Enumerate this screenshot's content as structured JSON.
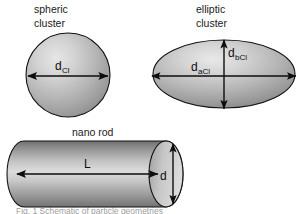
{
  "figure": {
    "width": 298,
    "height": 214,
    "background": "#ffffff",
    "outline_color": "#111111",
    "arrow_color": "#0d0d0d"
  },
  "panels": {
    "spheric": {
      "title_line1": "spheric",
      "title_line2": "cluster",
      "dimension": {
        "base": "d",
        "subscript": "Cl",
        "full": "dCl",
        "orientation": "horizontal",
        "arrow_style": "double-headed"
      },
      "shape": "sphere",
      "shading": {
        "type": "radial",
        "highlight": "#e0e0e0",
        "mid": "#b4b4b4",
        "shadow": "#8c8c8c"
      }
    },
    "elliptic": {
      "title_line1": "elliptic",
      "title_line2": "cluster",
      "dimension_major": {
        "base": "d",
        "subscript": "aCl",
        "full": "daCl",
        "orientation": "horizontal",
        "arrow_style": "double-headed"
      },
      "dimension_minor": {
        "base": "d",
        "subscript": "bCl",
        "full": "dbCl",
        "orientation": "vertical",
        "arrow_style": "double-headed"
      },
      "shape": "ellipse",
      "shading": {
        "type": "radial",
        "highlight": "#e2e2e2",
        "mid": "#b6b6b6",
        "shadow": "#8a8a8a"
      }
    },
    "nanorod": {
      "title": "nano rod",
      "dimension_length": {
        "base": "L",
        "subscript": "",
        "full": "L",
        "orientation": "horizontal",
        "arrow_style": "double-headed"
      },
      "dimension_diameter": {
        "base": "d",
        "subscript": "",
        "full": "d",
        "orientation": "vertical",
        "arrow_style": "double-headed"
      },
      "shape": "cylinder",
      "shading": {
        "type": "linear-vertical",
        "highlight": "#d8d8d8",
        "mid": "#b0b0b0",
        "shadow": "#7e7e7e"
      }
    }
  },
  "footer": {
    "clipped_caption": "Fig. 1  Schematic of particle geometries"
  }
}
